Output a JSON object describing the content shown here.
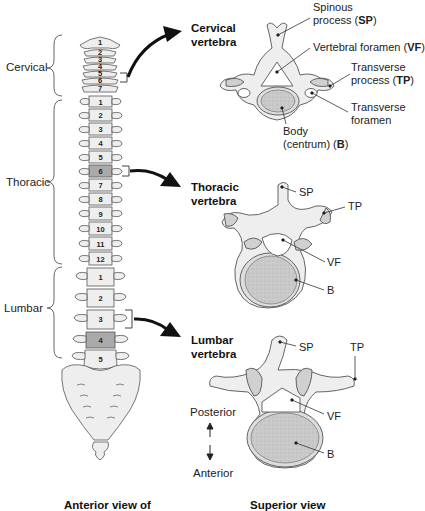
{
  "diagram": {
    "title_left": "Anterior view of",
    "title_right": "Superior view",
    "regions": [
      {
        "label": "Cervical",
        "count": 7,
        "numbers": [
          "1",
          "2",
          "3",
          "4",
          "5",
          "6",
          "7"
        ]
      },
      {
        "label": "Thoracic",
        "count": 12,
        "numbers": [
          "1",
          "2",
          "3",
          "4",
          "5",
          "6",
          "7",
          "8",
          "9",
          "10",
          "11",
          "12"
        ]
      },
      {
        "label": "Lumbar",
        "count": 5,
        "numbers": [
          "1",
          "2",
          "3",
          "4",
          "5"
        ]
      }
    ],
    "highlighted": {
      "cervical": "5",
      "thoracic": "6",
      "lumbar": "3"
    },
    "vertebra_views": {
      "cervical": {
        "title_line1": "Cervical",
        "title_line2": "vertebra",
        "labels": {
          "sp_line1": "Spinous",
          "sp_line2_prefix": "process (",
          "sp_abbr": "SP",
          "sp_suffix": ")",
          "vf_prefix": "Vertebral foramen (",
          "vf_abbr": "VF",
          "vf_suffix": ")",
          "tp_line1": "Transverse",
          "tp_line2_prefix": "process (",
          "tp_abbr": "TP",
          "tp_suffix": ")",
          "tf_line1": "Transverse",
          "tf_line2": "foramen",
          "body_line1": "Body",
          "body_line2_prefix": "(centrum) (",
          "body_abbr": "B",
          "body_suffix": ")"
        }
      },
      "thoracic": {
        "title_line1": "Thoracic",
        "title_line2": "vertebra",
        "labels": {
          "sp": "SP",
          "tp": "TP",
          "vf": "VF",
          "b": "B"
        }
      },
      "lumbar": {
        "title_line1": "Lumbar",
        "title_line2": "vertebra",
        "labels": {
          "sp": "SP",
          "tp": "TP",
          "vf": "VF",
          "b": "B"
        }
      }
    },
    "orientation": {
      "top": "Posterior",
      "bottom": "Anterior"
    },
    "colors": {
      "bone": "#eeeeee",
      "bone_outline": "#555555",
      "highlight": "#a9a9a9",
      "body_fill": "#c8c8c8",
      "arrow": "#111111"
    }
  }
}
